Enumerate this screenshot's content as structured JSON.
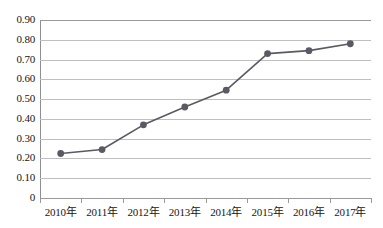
{
  "chart_data": {
    "type": "line",
    "title": "",
    "xlabel": "",
    "ylabel": "",
    "categories": [
      "2010年",
      "2011年",
      "2012年",
      "2013年",
      "2014年",
      "2015年",
      "2016年",
      "2017年"
    ],
    "values": [
      0.225,
      0.245,
      0.37,
      0.46,
      0.545,
      0.73,
      0.745,
      0.78
    ],
    "series": [
      {
        "name": "",
        "values": [
          0.225,
          0.245,
          0.37,
          0.46,
          0.545,
          0.73,
          0.745,
          0.78
        ]
      }
    ],
    "ylim": [
      0,
      0.9
    ],
    "ytick_values": [
      0.9,
      0.8,
      0.7,
      0.6,
      0.5,
      0.4,
      0.3,
      0.2,
      0.1,
      0
    ],
    "ytick_labels": [
      "0.90",
      "0.80",
      "0.70",
      "0.60",
      "0.50",
      "0.40",
      "0.30",
      "0.20",
      "0.10",
      "0"
    ],
    "grid": true,
    "legend": false,
    "legend_position": "none",
    "marker": "circle",
    "line_color": "#5a5a64",
    "marker_color": "#5a5a64",
    "gridline_color": "#bfbfbf",
    "axis_color": "#9a9a9a",
    "background_color": "#ffffff"
  }
}
